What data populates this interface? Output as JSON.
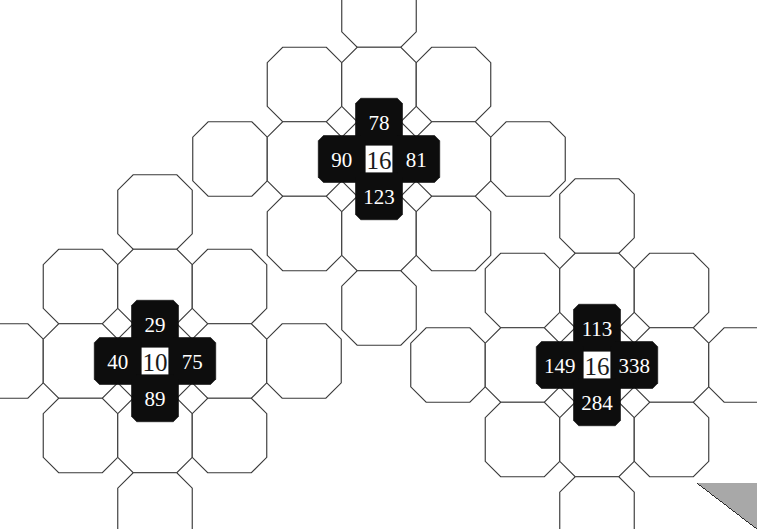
{
  "page": {
    "background": "#ffffff",
    "octagon_fill": "#ffffff",
    "octagon_stroke": "#3a3a3a",
    "square_fill": "#0d0d0d",
    "square_text_color": "#ffffff",
    "center_text_color": "#1a1a1a",
    "corner_artifact_color": "#a8a8a8"
  },
  "puzzles": [
    {
      "id": "puzzle-top",
      "position": {
        "left": 224,
        "top": 4
      },
      "center": "16",
      "top": "78",
      "left": "90",
      "right": "81",
      "bottom": "123"
    },
    {
      "id": "puzzle-bottom-left",
      "position": {
        "left": 0,
        "top": 206
      },
      "center": "10",
      "top": "29",
      "left": "40",
      "right": "75",
      "bottom": "89"
    },
    {
      "id": "puzzle-bottom-right",
      "position": {
        "left": 442,
        "top": 210
      },
      "center": "16",
      "top": "113",
      "left": "149",
      "right": "338",
      "bottom": "284"
    }
  ]
}
